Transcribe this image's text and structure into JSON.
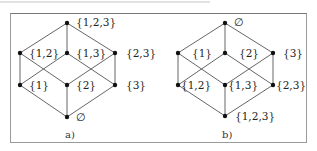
{
  "diagrams": [
    {
      "caption": "a)",
      "nodes": [
        {
          "label": "{1,2,3}",
          "x": 67,
          "y": 23,
          "lx": 76,
          "ly": 16
        },
        {
          "label": "{1,2}",
          "x": 20,
          "y": 53,
          "lx": 29,
          "ly": 47
        },
        {
          "label": "{1,3}",
          "x": 67,
          "y": 53,
          "lx": 76,
          "ly": 47
        },
        {
          "label": "{2,3}",
          "x": 115,
          "y": 53,
          "lx": 126,
          "ly": 47
        },
        {
          "label": "{1}",
          "x": 20,
          "y": 85,
          "lx": 29,
          "ly": 79
        },
        {
          "label": "{2}",
          "x": 67,
          "y": 85,
          "lx": 76,
          "ly": 79
        },
        {
          "label": "{3}",
          "x": 115,
          "y": 85,
          "lx": 126,
          "ly": 79
        },
        {
          "label": "∅",
          "x": 67,
          "y": 117,
          "lx": 76,
          "ly": 111
        }
      ],
      "edges": [
        [
          0,
          1
        ],
        [
          0,
          2
        ],
        [
          0,
          3
        ],
        [
          1,
          4
        ],
        [
          1,
          5
        ],
        [
          2,
          4
        ],
        [
          2,
          6
        ],
        [
          3,
          5
        ],
        [
          3,
          6
        ],
        [
          4,
          7
        ],
        [
          5,
          7
        ],
        [
          6,
          7
        ]
      ],
      "caption_pos": {
        "x": 65,
        "y": 129
      }
    },
    {
      "caption": "b)",
      "nodes": [
        {
          "label": "∅",
          "x": 225,
          "y": 23,
          "lx": 234,
          "ly": 16
        },
        {
          "label": "{1}",
          "x": 178,
          "y": 53,
          "lx": 192,
          "ly": 47
        },
        {
          "label": "{2}",
          "x": 225,
          "y": 53,
          "lx": 239,
          "ly": 47
        },
        {
          "label": "{3}",
          "x": 273,
          "y": 53,
          "lx": 283,
          "ly": 47
        },
        {
          "label": "{1,2}",
          "x": 178,
          "y": 85,
          "lx": 181,
          "ly": 79
        },
        {
          "label": "{1,3}",
          "x": 225,
          "y": 85,
          "lx": 228,
          "ly": 79
        },
        {
          "label": "{2,3}",
          "x": 273,
          "y": 85,
          "lx": 276,
          "ly": 79
        },
        {
          "label": "{1,2,3}",
          "x": 225,
          "y": 116,
          "lx": 235,
          "ly": 110
        }
      ],
      "edges": [
        [
          0,
          1
        ],
        [
          0,
          2
        ],
        [
          0,
          3
        ],
        [
          1,
          4
        ],
        [
          1,
          5
        ],
        [
          2,
          4
        ],
        [
          2,
          6
        ],
        [
          3,
          5
        ],
        [
          3,
          6
        ],
        [
          4,
          7
        ],
        [
          5,
          7
        ],
        [
          6,
          7
        ]
      ],
      "caption_pos": {
        "x": 222,
        "y": 129
      }
    }
  ],
  "colors": {
    "line": "#555555",
    "node": "#111111",
    "frame": "#9a9a9a"
  }
}
